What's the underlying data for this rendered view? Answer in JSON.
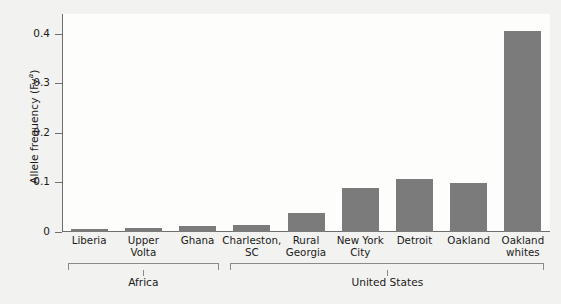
{
  "chart_data": {
    "type": "bar",
    "title": "",
    "xlabel": "",
    "ylabel": "Allele frequency (Fy",
    "ylabel_sup": "a",
    "ylabel_close": ")",
    "categories": [
      "Liberia",
      "Upper Volta",
      "Ghana",
      "Charleston, SC",
      "Rural Georgia",
      "New York City",
      "Detroit",
      "Oakland",
      "Oakland whites"
    ],
    "category_lines": [
      [
        "Liberia"
      ],
      [
        "Upper",
        "Volta"
      ],
      [
        "Ghana"
      ],
      [
        "Charleston,",
        "SC"
      ],
      [
        "Rural",
        "Georgia"
      ],
      [
        "New York",
        "City"
      ],
      [
        "Detroit"
      ],
      [
        "Oakland"
      ],
      [
        "Oakland",
        "whites"
      ]
    ],
    "values": [
      0.006,
      0.008,
      0.012,
      0.015,
      0.039,
      0.089,
      0.107,
      0.098,
      0.405
    ],
    "ylim": [
      0,
      0.44
    ],
    "yticks": [
      0,
      0.1,
      0.2,
      0.3,
      0.4
    ],
    "ytick_labels": [
      "0",
      "0.1",
      "0.2",
      "0.3",
      "0.4"
    ],
    "grid": false,
    "legend": null,
    "bar_color": "#7b7b7b",
    "axis_color": "#6e6e6e",
    "plot_background": "#fdfdfc",
    "page_background": "#f2f2f0",
    "groups": [
      {
        "label": "Africa",
        "start_index": 0,
        "end_index": 2
      },
      {
        "label": "United States",
        "start_index": 3,
        "end_index": 8
      }
    ]
  }
}
